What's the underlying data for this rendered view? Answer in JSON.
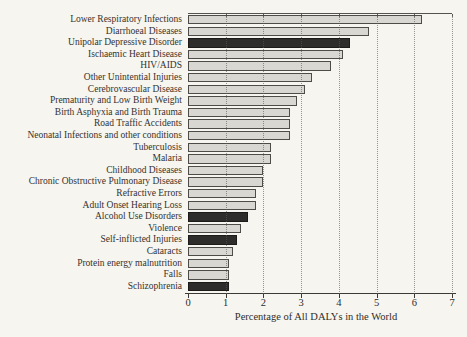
{
  "figure": {
    "background_color": "#f7f5f0"
  },
  "chart_data": {
    "type": "bar",
    "orientation": "horizontal",
    "title": "",
    "xlabel": "Percentage of All DALYs in the World",
    "ylabel": "",
    "xlim": [
      0,
      7
    ],
    "x_ticks": [
      "0",
      "1",
      "2",
      "3",
      "4",
      "5",
      "6",
      "7"
    ],
    "grid": "vertical dotted gridlines at each integer",
    "legend": "none",
    "categories": [
      "Lower Respiratory Infections",
      "Diarrhoeal Diseases",
      "Unipolar Depressive Disorder",
      "Ischaemic Heart Disease",
      "HIV/AIDS",
      "Other Unintential Injuries",
      "Cerebrovascular Disease",
      "Prematurity and Low Birth Weight",
      "Birth Asphyxia and Birth Trauma",
      "Road Traffic Accidents",
      "Neonatal Infections and other conditions",
      "Tuberculosis",
      "Malaria",
      "Childhood Diseases",
      "Chronic Obstructive Pulmonary Disease",
      "Refractive Errors",
      "Adult Onset Hearing Loss",
      "Alcohol Use Disorders",
      "Violence",
      "Self-inflicted Injuries",
      "Cataracts",
      "Protein energy malnutrition",
      "Falls",
      "Schizophrenia"
    ],
    "values": [
      6.2,
      4.8,
      4.3,
      4.1,
      3.8,
      3.3,
      3.1,
      2.9,
      2.7,
      2.7,
      2.7,
      2.2,
      2.2,
      2.0,
      2.0,
      1.8,
      1.8,
      1.6,
      1.4,
      1.3,
      1.2,
      1.1,
      1.1,
      1.1
    ],
    "highlighted": [
      false,
      false,
      true,
      false,
      false,
      false,
      false,
      false,
      false,
      false,
      false,
      false,
      false,
      false,
      false,
      false,
      false,
      true,
      false,
      true,
      false,
      false,
      false,
      true
    ],
    "colors": {
      "default_bar": "#d8d7d1",
      "highlight_bar": "#2e2d2c",
      "bar_border": "#4e4c49",
      "axis": "#3c3a36",
      "gridline": "#5c5954"
    }
  }
}
